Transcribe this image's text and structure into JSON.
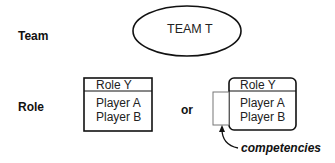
{
  "rows": {
    "team_label": "Team",
    "role_label": "Role"
  },
  "team": {
    "name": "TEAM T"
  },
  "role_plain": {
    "title": "Role Y",
    "players": [
      "Player A",
      "Player B"
    ]
  },
  "connector": "or",
  "role_with_competencies": {
    "title": "Role Y",
    "players": [
      "Player A",
      "Player B"
    ],
    "annotation": "competencies"
  },
  "colors": {
    "stroke": "#111111",
    "competency_box_stroke": "#777777",
    "background": "#ffffff"
  }
}
